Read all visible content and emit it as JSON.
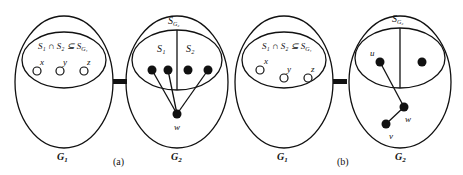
{
  "figure": {
    "panels": [
      {
        "id": "a",
        "caption": "(a)",
        "left_graph": {
          "name": "G",
          "sub": "1",
          "set_label": "S₁ ∩ S₂ ⊆ S",
          "set_label_sub": "G₁",
          "vertices": [
            "x",
            "y",
            "z"
          ]
        },
        "right_graph": {
          "name": "G",
          "sub": "2",
          "set_name": "S",
          "set_sub": "G₂",
          "part_left": "S₁",
          "part_right": "S₂",
          "hub_vertex": "w"
        }
      },
      {
        "id": "b",
        "caption": "(b)",
        "left_graph": {
          "name": "G",
          "sub": "1",
          "set_label": "S₁ ∩ S₂ ⊆ S",
          "set_label_sub": "G₁",
          "vertices": [
            "x",
            "y",
            "z"
          ]
        },
        "right_graph": {
          "name": "G",
          "sub": "2",
          "set_name": "S",
          "set_sub": "G₂",
          "vertices": [
            "u",
            "w",
            "v"
          ]
        }
      }
    ]
  }
}
